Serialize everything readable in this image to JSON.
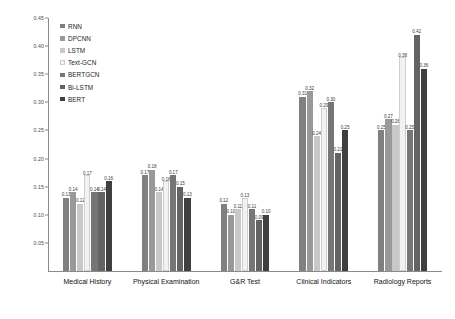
{
  "chart_data": {
    "type": "bar",
    "title": "",
    "xlabel": "",
    "ylabel": "",
    "ylim": [
      0.0,
      0.45
    ],
    "ytick_labels": [
      "0.45",
      "0.40",
      "0.35",
      "0.30",
      "0.25",
      "0.20",
      "0.15",
      "0.10",
      "0.05"
    ],
    "ytick_values": [
      0.45,
      0.4,
      0.35,
      0.3,
      0.25,
      0.2,
      0.15,
      0.1,
      0.05
    ],
    "grid": false,
    "legend_position": "upper-left",
    "categories": [
      "Medical History",
      "Physical Examination",
      "G&R Test",
      "Clinical Indicators",
      "Radiology Reports"
    ],
    "series": [
      {
        "name": "RNN",
        "color": "#808080",
        "values": [
          0.13,
          0.17,
          0.12,
          0.31,
          0.25
        ]
      },
      {
        "name": "DPCNN",
        "color": "#999999",
        "values": [
          0.14,
          0.18,
          0.1,
          0.32,
          0.27
        ]
      },
      {
        "name": "LSTM",
        "color": "#c8c8c8",
        "values": [
          0.12,
          0.14,
          0.11,
          0.24,
          0.26
        ]
      },
      {
        "name": "Text-GCN",
        "color": "#f2f2f2",
        "values": [
          0.17,
          0.16,
          0.13,
          0.29,
          0.38
        ]
      },
      {
        "name": "BERTGCN",
        "color": "#767676",
        "values": [
          0.14,
          0.17,
          0.11,
          0.3,
          0.25
        ]
      },
      {
        "name": "Bi-LSTM",
        "color": "#636363",
        "values": [
          0.14,
          0.15,
          0.09,
          0.21,
          0.42
        ]
      },
      {
        "name": "BERT",
        "color": "#3f3f3f",
        "values": [
          0.16,
          0.13,
          0.1,
          0.25,
          0.36
        ]
      }
    ],
    "value_labels": [
      [
        "0.13",
        "0.14",
        "0.12",
        "0.17",
        "0.14",
        "0.14",
        "0.16"
      ],
      [
        "0.17",
        "0.18",
        "0.14",
        "0.16",
        "0.17",
        "0.15",
        "0.13"
      ],
      [
        "0.12",
        "0.10",
        "0.11",
        "0.13",
        "0.11",
        "0.09",
        "0.10"
      ],
      [
        "0.31",
        "0.32",
        "0.24",
        "0.29",
        "0.30",
        "0.21",
        "0.25"
      ],
      [
        "0.25",
        "0.27",
        "0.26",
        "0.38",
        "0.25",
        "0.42",
        "0.36"
      ]
    ]
  }
}
